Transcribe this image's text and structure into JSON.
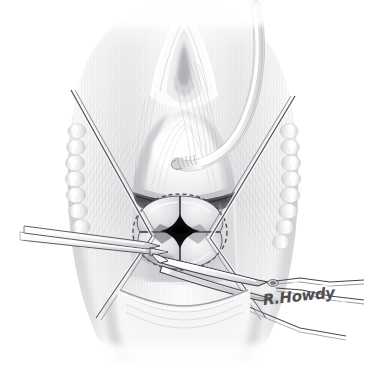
{
  "figure": {
    "title": "Cruciate incision of the cricothyroid membrane",
    "background_color": "#ffffff",
    "medium": "grayscale pencil and airbrush medical illustration",
    "width": 366,
    "height": 365
  },
  "signature": {
    "text": "R.Howdy",
    "color": "#4e4e52",
    "position": "lower right"
  },
  "palette": {
    "paper": "#ffffff",
    "tissue_light": "#f4f4f5",
    "tissue_mid": "#dcdcde",
    "tissue_shadow": "#b8b8bb",
    "deep_shadow": "#8a8a8e",
    "ink_line": "#54545a",
    "aperture_black": "#101012",
    "instrument_steel": "#fafafa",
    "instrument_edge": "#3c3c42",
    "dashed_marking": "#3a3a40"
  },
  "anatomy": {
    "items": [
      {
        "name": "thyroid-notch",
        "label": "Thyroid notch / laryngeal prominence"
      },
      {
        "name": "thyroid-cartilage",
        "label": "Thyroid cartilage"
      },
      {
        "name": "cricothyroid-membrane",
        "label": "Cricothyroid membrane"
      },
      {
        "name": "cricoid-cartilage",
        "label": "Cricoid cartilage"
      },
      {
        "name": "tracheal-rings-left",
        "label": "Tracheal cartilage rings, left"
      },
      {
        "name": "tracheal-rings-right",
        "label": "Tracheal cartilage rings, right"
      },
      {
        "name": "strap-muscles",
        "label": "Strap muscles"
      },
      {
        "name": "sternal-notch",
        "label": "Suprasternal region"
      }
    ]
  },
  "markings": {
    "dashed_circle": {
      "name": "incision-outline",
      "label": "Dashed circular incision outline",
      "center_x": 180,
      "center_y": 232,
      "radius_x": 47,
      "radius_y": 38,
      "dash_pattern": "4 3"
    },
    "cruciate_incision": {
      "name": "cruciate-incision",
      "label": "Cruciate (cross) incision, four flaps",
      "arms": [
        "superior",
        "inferior",
        "left lateral",
        "right lateral"
      ]
    },
    "aperture": {
      "name": "central-aperture",
      "label": "Open airway lumen",
      "shape": "four-point star",
      "color": "#101012"
    }
  },
  "instruments": {
    "items": [
      {
        "name": "retraction-suture-left",
        "label": "Retraction suture, left",
        "type": "suture",
        "from": "upper left",
        "to": "incision edge"
      },
      {
        "name": "retraction-suture-right",
        "label": "Retraction suture, right",
        "type": "suture",
        "from": "upper right",
        "to": "incision edge"
      },
      {
        "name": "forceps-left",
        "label": "Tissue forceps entering from the left",
        "type": "forceps",
        "from": "left margin"
      },
      {
        "name": "curved-scissors",
        "label": "Curved surgical scissors",
        "type": "scissors",
        "from": "lower right",
        "has_pivot_screw": true
      },
      {
        "name": "endotracheal-tube",
        "label": "Curved tube passing behind the larynx",
        "type": "tube",
        "from": "upper right"
      }
    ]
  }
}
